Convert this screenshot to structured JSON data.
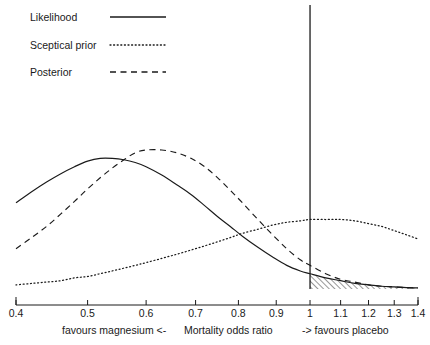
{
  "legend": {
    "items": [
      {
        "label": "Likelihood",
        "style": "solid",
        "key": "likelihood"
      },
      {
        "label": "Sceptical prior",
        "style": "dotted",
        "key": "sceptical_prior"
      },
      {
        "label": "Posterior",
        "style": "dashed",
        "key": "posterior"
      }
    ]
  },
  "axis": {
    "tick_labels": [
      "0.4",
      "0.5",
      "0.6",
      "0.7",
      "0.8",
      "0.9",
      "1",
      "1.1",
      "1.2",
      "1.3",
      "1.4"
    ]
  },
  "captions": {
    "left": "favours magnesium  <-",
    "center": "Mortality odds ratio",
    "right": "->  favours placebo"
  },
  "chart_data": {
    "type": "line",
    "title": "",
    "xlabel": "Mortality odds ratio",
    "ylabel": "",
    "xscale": "log",
    "xlim": [
      0.4,
      1.4
    ],
    "ylim": [
      0,
      1
    ],
    "grid": false,
    "legend_position": "top-left",
    "xticks": [
      0.4,
      0.5,
      0.6,
      0.7,
      0.8,
      0.9,
      1.0,
      1.1,
      1.2,
      1.3,
      1.4
    ],
    "xtick_labels": [
      "0.4",
      "0.5",
      "0.6",
      "0.7",
      "0.8",
      "0.9",
      "1",
      "1.1",
      "1.2",
      "1.3",
      "1.4"
    ],
    "reference_line": {
      "x": 1.0,
      "label": "no effect",
      "style": "solid"
    },
    "shaded_region": {
      "series": "Likelihood",
      "from_x": 1.0,
      "to_x": 1.4,
      "pattern": "diagonal-hatch",
      "description": "area under the likelihood curve to the right of an odds ratio of 1"
    },
    "x": [
      0.4,
      0.42,
      0.44,
      0.46,
      0.48,
      0.5,
      0.52,
      0.54,
      0.56,
      0.58,
      0.6,
      0.63,
      0.66,
      0.69,
      0.72,
      0.75,
      0.78,
      0.81,
      0.85,
      0.89,
      0.93,
      0.97,
      1.0,
      1.05,
      1.1,
      1.15,
      1.2,
      1.25,
      1.3,
      1.35,
      1.4
    ],
    "series": [
      {
        "name": "Likelihood",
        "style": "solid",
        "peak_x": 0.53,
        "values": [
          0.62,
          0.7,
          0.77,
          0.83,
          0.88,
          0.92,
          0.94,
          0.94,
          0.93,
          0.91,
          0.88,
          0.82,
          0.75,
          0.68,
          0.6,
          0.52,
          0.45,
          0.38,
          0.3,
          0.23,
          0.17,
          0.13,
          0.11,
          0.08,
          0.06,
          0.04,
          0.03,
          0.02,
          0.015,
          0.01,
          0.008
        ]
      },
      {
        "name": "Sceptical prior",
        "style": "dotted",
        "peak_x": 1.03,
        "values": [
          0.03,
          0.04,
          0.05,
          0.06,
          0.08,
          0.09,
          0.11,
          0.13,
          0.15,
          0.17,
          0.19,
          0.22,
          0.25,
          0.28,
          0.31,
          0.34,
          0.37,
          0.4,
          0.43,
          0.46,
          0.48,
          0.49,
          0.5,
          0.5,
          0.5,
          0.49,
          0.47,
          0.45,
          0.42,
          0.39,
          0.36
        ]
      },
      {
        "name": "Posterior",
        "style": "dashed",
        "peak_x": 0.63,
        "values": [
          0.29,
          0.37,
          0.45,
          0.54,
          0.63,
          0.72,
          0.8,
          0.87,
          0.93,
          0.98,
          1.0,
          1.0,
          0.98,
          0.94,
          0.88,
          0.8,
          0.71,
          0.62,
          0.5,
          0.39,
          0.29,
          0.21,
          0.17,
          0.11,
          0.07,
          0.05,
          0.03,
          0.02,
          0.015,
          0.01,
          0.006
        ]
      }
    ]
  }
}
